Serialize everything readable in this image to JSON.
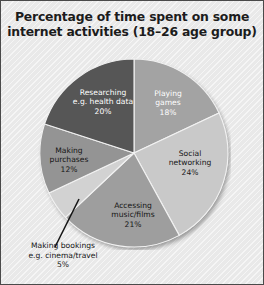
{
  "figure": {
    "title_line1": "Percentage of time spent on some",
    "title_line2": "internet activities (18–26 age group)",
    "frame_color": "#4a4a4a",
    "background_color": "#e9e9e9"
  },
  "chart_data": {
    "type": "pie",
    "title": "Percentage of time spent on some internet activities (18–26 age group)",
    "xlabel": "",
    "ylabel": "",
    "units": "percent",
    "total": 100,
    "start_angle_deg": 0,
    "direction": "clockwise",
    "legend": "none (labels placed on slices)",
    "grid": false,
    "categories": [
      "Playing games",
      "Social networking",
      "Accessing music/films",
      "Making bookings e.g. cinema/travel",
      "Making purchases",
      "Researching e.g. health data"
    ],
    "values": [
      18,
      24,
      21,
      5,
      12,
      20
    ],
    "colors": [
      "#a3a3a3",
      "#c9c9c9",
      "#9e9e9e",
      "#d2d2d2",
      "#949494",
      "#565656"
    ],
    "slices": [
      {
        "name": "Playing games",
        "value": 18,
        "label_line1": "Playing",
        "label_line2": "games",
        "label_pct": "18%",
        "color": "#a3a3a3",
        "label_on_dark": true
      },
      {
        "name": "Social networking",
        "value": 24,
        "label_line1": "Social",
        "label_line2": "networking",
        "label_pct": "24%",
        "color": "#c9c9c9",
        "label_on_dark": false
      },
      {
        "name": "Accessing music/films",
        "value": 21,
        "label_line1": "Accessing",
        "label_line2": "music/films",
        "label_pct": "21%",
        "color": "#9e9e9e",
        "label_on_dark": false
      },
      {
        "name": "Making bookings e.g. cinema/travel",
        "value": 5,
        "label_line1": "Making bookings",
        "label_line2": "e.g. cinema/travel",
        "label_pct": "5%",
        "color": "#d2d2d2",
        "label_on_dark": false,
        "callout": true
      },
      {
        "name": "Making purchases",
        "value": 12,
        "label_line1": "Making",
        "label_line2": "purchases",
        "label_pct": "12%",
        "color": "#949494",
        "label_on_dark": false
      },
      {
        "name": "Researching e.g. health data",
        "value": 20,
        "label_line1": "Researching",
        "label_line2": "e.g. health data",
        "label_pct": "20%",
        "color": "#565656",
        "label_on_dark": true
      }
    ]
  }
}
